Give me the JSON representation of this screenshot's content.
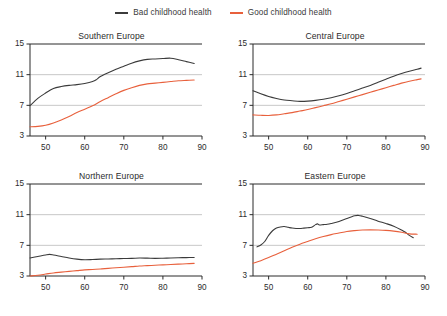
{
  "legend": {
    "position": "top-center",
    "entries": [
      {
        "label": "Bad childhood health",
        "color": "#3b3b3b",
        "icon": "line-swatch-icon"
      },
      {
        "label": "Good childhood health",
        "color": "#e8603c",
        "icon": "line-swatch-icon"
      }
    ]
  },
  "chart_data": {
    "type": "line",
    "title": "",
    "xlabel": "",
    "ylabel": "",
    "xlim": [
      46,
      90
    ],
    "ylim": [
      3,
      15
    ],
    "xticks": [
      50,
      60,
      70,
      80,
      90
    ],
    "yticks": [
      3,
      7,
      11,
      15
    ],
    "grid": "horizontal",
    "colors": {
      "bad": "#3b3b3b",
      "good": "#e8603c"
    },
    "panels": [
      {
        "title": "Southern Europe",
        "series": [
          {
            "name": "Bad childhood health",
            "color": "#3b3b3b",
            "x": [
              46,
              48,
              50,
              52,
              54,
              56,
              58,
              60,
              62,
              63,
              64,
              66,
              68,
              70,
              72,
              74,
              76,
              78,
              80,
              82,
              84,
              86,
              88
            ],
            "y": [
              6.95,
              7.9,
              8.6,
              9.2,
              9.45,
              9.6,
              9.7,
              9.85,
              10.1,
              10.35,
              10.75,
              11.25,
              11.7,
              12.1,
              12.5,
              12.8,
              13.0,
              13.05,
              13.1,
              13.15,
              12.95,
              12.7,
              12.45
            ]
          },
          {
            "name": "Good childhood health",
            "color": "#e8603c",
            "x": [
              46,
              48,
              50,
              52,
              54,
              56,
              58,
              60,
              62,
              64,
              66,
              68,
              70,
              72,
              74,
              76,
              78,
              80,
              82,
              84,
              86,
              88
            ],
            "y": [
              4.2,
              4.25,
              4.4,
              4.7,
              5.1,
              5.55,
              6.05,
              6.5,
              6.95,
              7.5,
              8.0,
              8.5,
              8.95,
              9.3,
              9.6,
              9.8,
              9.9,
              10.0,
              10.1,
              10.2,
              10.25,
              10.3
            ]
          }
        ]
      },
      {
        "title": "Central Europe",
        "series": [
          {
            "name": "Bad childhood health",
            "color": "#3b3b3b",
            "x": [
              46,
              48,
              50,
              52,
              54,
              56,
              58,
              60,
              62,
              64,
              66,
              68,
              70,
              72,
              74,
              76,
              78,
              80,
              82,
              84,
              86,
              88,
              89
            ],
            "y": [
              8.9,
              8.5,
              8.15,
              7.9,
              7.7,
              7.6,
              7.52,
              7.55,
              7.65,
              7.8,
              8.0,
              8.25,
              8.55,
              8.9,
              9.25,
              9.6,
              10.0,
              10.4,
              10.8,
              11.15,
              11.45,
              11.7,
              11.85
            ]
          },
          {
            "name": "Good childhood health",
            "color": "#e8603c",
            "x": [
              46,
              48,
              50,
              52,
              54,
              56,
              58,
              60,
              62,
              64,
              66,
              68,
              70,
              72,
              74,
              76,
              78,
              80,
              82,
              84,
              86,
              88,
              89
            ],
            "y": [
              5.75,
              5.7,
              5.68,
              5.75,
              5.9,
              6.05,
              6.25,
              6.45,
              6.7,
              6.95,
              7.2,
              7.5,
              7.8,
              8.1,
              8.4,
              8.7,
              9.0,
              9.3,
              9.6,
              9.9,
              10.15,
              10.35,
              10.45
            ]
          }
        ]
      },
      {
        "title": "Northern Europe",
        "series": [
          {
            "name": "Bad childhood health",
            "color": "#3b3b3b",
            "x": [
              46,
              48,
              50,
              51,
              52,
              54,
              56,
              58,
              60,
              62,
              64,
              66,
              68,
              70,
              72,
              74,
              76,
              78,
              80,
              82,
              84,
              86,
              88
            ],
            "y": [
              5.35,
              5.55,
              5.75,
              5.82,
              5.75,
              5.55,
              5.35,
              5.2,
              5.12,
              5.15,
              5.2,
              5.22,
              5.25,
              5.28,
              5.3,
              5.35,
              5.33,
              5.3,
              5.32,
              5.35,
              5.38,
              5.4,
              5.42
            ]
          },
          {
            "name": "Good childhood health",
            "color": "#e8603c",
            "x": [
              46,
              48,
              50,
              52,
              54,
              56,
              58,
              60,
              62,
              64,
              66,
              68,
              70,
              72,
              74,
              76,
              78,
              80,
              82,
              84,
              86,
              88
            ],
            "y": [
              3.0,
              3.1,
              3.25,
              3.4,
              3.5,
              3.6,
              3.7,
              3.8,
              3.85,
              3.92,
              4.0,
              4.08,
              4.15,
              4.22,
              4.3,
              4.35,
              4.4,
              4.45,
              4.5,
              4.55,
              4.6,
              4.65
            ]
          }
        ]
      },
      {
        "title": "Eastern Europe",
        "series": [
          {
            "name": "Bad childhood health",
            "color": "#3b3b3b",
            "x": [
              47,
              48,
              49,
              50,
              51,
              52,
              53,
              54,
              55,
              56,
              57,
              58,
              59,
              60,
              61,
              62,
              62.5,
              63,
              64,
              65,
              66,
              68,
              70,
              72,
              73,
              74,
              76,
              78,
              80,
              82,
              84,
              85,
              86,
              87
            ],
            "y": [
              6.8,
              7.05,
              7.5,
              8.3,
              8.9,
              9.25,
              9.4,
              9.45,
              9.35,
              9.25,
              9.2,
              9.2,
              9.25,
              9.3,
              9.35,
              9.7,
              9.8,
              9.65,
              9.7,
              9.75,
              9.85,
              10.1,
              10.5,
              10.85,
              10.9,
              10.8,
              10.5,
              10.15,
              9.85,
              9.5,
              9.0,
              8.7,
              8.3,
              8.0
            ]
          },
          {
            "name": "Good childhood health",
            "color": "#e8603c",
            "x": [
              46,
              48,
              50,
              52,
              54,
              56,
              58,
              60,
              62,
              64,
              66,
              68,
              70,
              72,
              74,
              76,
              78,
              80,
              82,
              84,
              86,
              88
            ],
            "y": [
              4.65,
              5.0,
              5.4,
              5.85,
              6.3,
              6.75,
              7.15,
              7.5,
              7.85,
              8.15,
              8.4,
              8.6,
              8.8,
              8.92,
              9.0,
              9.02,
              9.0,
              8.95,
              8.85,
              8.7,
              8.5,
              8.45
            ]
          }
        ]
      }
    ]
  }
}
